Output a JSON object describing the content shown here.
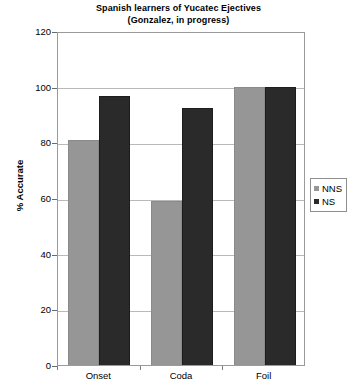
{
  "chart_data": {
    "type": "bar",
    "title": "Spanish learners of Yucatec Ejectives",
    "subtitle": "(Gonzalez, in progress)",
    "xlabel": "",
    "ylabel": "% Accurate",
    "categories": [
      "Onset",
      "Coda",
      "Foil"
    ],
    "series": [
      {
        "name": "NNS",
        "color": "#969696",
        "values": [
          81,
          59,
          100
        ]
      },
      {
        "name": "NS",
        "color": "#2a2a2a",
        "values": [
          96.5,
          92.5,
          100
        ]
      }
    ],
    "ylim": [
      0,
      120
    ],
    "ytick_step": 20,
    "yticks": [
      "120",
      "100",
      "80",
      "60",
      "40",
      "20",
      "0"
    ],
    "grid": true,
    "legend_position": "right"
  },
  "legend": {
    "entries": [
      {
        "label": "NNS",
        "marker": "square-marker"
      },
      {
        "label": "NS",
        "marker": "square-marker"
      }
    ]
  }
}
